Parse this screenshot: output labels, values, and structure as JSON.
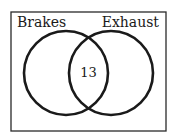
{
  "diagram": {
    "type": "venn",
    "sets": [
      {
        "label": "Brakes"
      },
      {
        "label": "Exhaust"
      }
    ],
    "regions": {
      "intersection": "13"
    },
    "colors": {
      "stroke": "#1a1a1a",
      "background": "#ffffff"
    }
  }
}
